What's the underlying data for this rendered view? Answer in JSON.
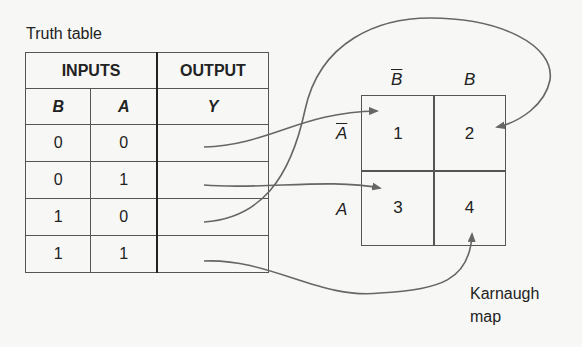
{
  "truth_table": {
    "title": "Truth table",
    "group_headers": [
      "INPUTS",
      "OUTPUT"
    ],
    "columns": [
      "B",
      "A",
      "Y"
    ],
    "rows": [
      {
        "B": "0",
        "A": "0",
        "Y": ""
      },
      {
        "B": "0",
        "A": "1",
        "Y": ""
      },
      {
        "B": "1",
        "A": "0",
        "Y": ""
      },
      {
        "B": "1",
        "A": "1",
        "Y": ""
      }
    ]
  },
  "kmap": {
    "col_labels": [
      "B",
      "B"
    ],
    "col_label_overline": [
      true,
      false
    ],
    "row_labels": [
      "A",
      "A"
    ],
    "row_label_overline": [
      true,
      false
    ],
    "cells": [
      "1",
      "2",
      "3",
      "4"
    ],
    "caption_line1": "Karnaugh",
    "caption_line2": "map"
  },
  "arrows": [
    {
      "from_row": "B=0,A=0",
      "to_cell": "1"
    },
    {
      "from_row": "B=0,A=1",
      "to_cell": "3"
    },
    {
      "from_row": "B=1,A=0",
      "to_cell": "2"
    },
    {
      "from_row": "B=1,A=1",
      "to_cell": "4"
    }
  ],
  "colors": {
    "line": "#555555",
    "arrow": "#666666",
    "background": "#f7f7f5"
  }
}
